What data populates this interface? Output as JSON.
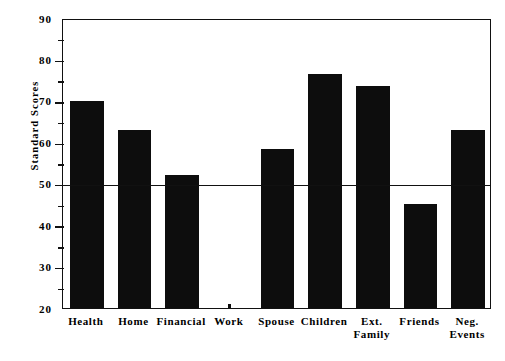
{
  "chart_data": {
    "type": "bar",
    "title": "Life  Stressors",
    "title_words": [
      "Life",
      "Stressors"
    ],
    "xlabel": "",
    "ylabel": "Standard Scores",
    "ylim": [
      20,
      90
    ],
    "ytick_major": [
      20,
      30,
      40,
      50,
      60,
      70,
      80,
      90
    ],
    "ytick_minor": [
      25,
      35,
      45,
      55,
      65,
      75,
      85
    ],
    "ytick_labels": [
      "20",
      "30",
      "40",
      "50",
      "60",
      "70",
      "80",
      "90"
    ],
    "grid": false,
    "legend": "none",
    "reference_line": 50,
    "bar_color": "#0d0d0d",
    "axis_color": "#111111",
    "categories": [
      "Health",
      "Home",
      "Financial",
      "Work",
      "Spouse",
      "Children",
      "Ext.\nFamily",
      "Friends",
      "Neg.\nEvents"
    ],
    "values": [
      70,
      63,
      52,
      20,
      58.5,
      76.5,
      73.5,
      45,
      63
    ]
  },
  "chart": {
    "title": "Life  Stressors",
    "y_axis_title": "Standard Scores"
  }
}
